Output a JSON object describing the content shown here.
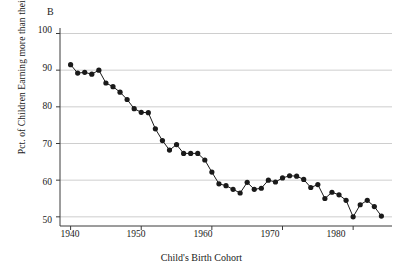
{
  "chart_data": {
    "type": "line",
    "title": "",
    "panel_label": "B",
    "xlabel": "Child's Birth Cohort",
    "ylabel": "Pct. of Children Earning more than their Parents",
    "xlim": [
      1938.5,
      1985.5
    ],
    "ylim": [
      47.5,
      101.5
    ],
    "xticks": [
      1940,
      1950,
      1960,
      1970,
      1980
    ],
    "xticklabels": [
      "1940",
      "1950",
      "1960",
      "1970",
      "1980"
    ],
    "yticks": [
      50,
      60,
      70,
      80,
      90,
      100
    ],
    "yticklabels": [
      "50",
      "60",
      "70",
      "80",
      "90",
      "100"
    ],
    "grid": "horizontal",
    "legend": "none",
    "marker": "filled-circle",
    "line_color": "#1a1a1a",
    "marker_color": "#1a1a1a",
    "grid_color": "#b9b9b9",
    "x": [
      1940,
      1941,
      1942,
      1943,
      1944,
      1945,
      1946,
      1947,
      1948,
      1949,
      1950,
      1951,
      1952,
      1953,
      1954,
      1955,
      1956,
      1957,
      1958,
      1959,
      1960,
      1961,
      1962,
      1963,
      1964,
      1965,
      1966,
      1967,
      1968,
      1969,
      1970,
      1971,
      1972,
      1973,
      1974,
      1975,
      1976,
      1977,
      1978,
      1979,
      1980,
      1981,
      1982,
      1983,
      1984
    ],
    "values": [
      91.5,
      89.2,
      89.4,
      88.9,
      90.0,
      86.5,
      85.5,
      84.0,
      82.0,
      79.5,
      78.5,
      78.4,
      74.0,
      70.8,
      68.2,
      69.7,
      67.3,
      67.3,
      67.3,
      65.5,
      62.2,
      59.0,
      58.5,
      57.5,
      56.5,
      59.4,
      57.5,
      57.8,
      60.0,
      59.5,
      60.6,
      61.2,
      61.1,
      60.2,
      58.0,
      58.8,
      55.0,
      56.7,
      56.0,
      54.5,
      50.0,
      53.3,
      54.5,
      52.8,
      50.2
    ],
    "categories": [
      "1940",
      "1941",
      "1942",
      "1943",
      "1944",
      "1945",
      "1946",
      "1947",
      "1948",
      "1949",
      "1950",
      "1951",
      "1952",
      "1953",
      "1954",
      "1955",
      "1956",
      "1957",
      "1958",
      "1959",
      "1960",
      "1961",
      "1962",
      "1963",
      "1964",
      "1965",
      "1966",
      "1967",
      "1968",
      "1969",
      "1970",
      "1971",
      "1972",
      "1973",
      "1974",
      "1975",
      "1976",
      "1977",
      "1978",
      "1979",
      "1980",
      "1981",
      "1982",
      "1983",
      "1984"
    ],
    "series": [
      {
        "name": "Pct. of Children Earning more than their Parents",
        "values": [
          91.5,
          89.2,
          89.4,
          88.9,
          90.0,
          86.5,
          85.5,
          84.0,
          82.0,
          79.5,
          78.5,
          78.4,
          74.0,
          70.8,
          68.2,
          69.7,
          67.3,
          67.3,
          67.3,
          65.5,
          62.2,
          59.0,
          58.5,
          57.5,
          56.5,
          59.4,
          57.5,
          57.8,
          60.0,
          59.5,
          60.6,
          61.2,
          61.1,
          60.2,
          58.0,
          58.8,
          55.0,
          56.7,
          56.0,
          54.5,
          50.0,
          53.3,
          54.5,
          52.8,
          50.2
        ]
      }
    ]
  }
}
